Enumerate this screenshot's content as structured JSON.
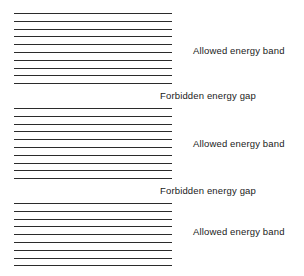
{
  "diagram": {
    "background_color": "#ffffff",
    "line_color": "#2b2b2b",
    "text_color": "#1a1a1a",
    "labels": {
      "allowed": "Allowed energy band",
      "forbidden": "Forbidden energy gap"
    },
    "bands": [
      {
        "id": "allowed-band-1",
        "label": "Allowed energy band",
        "label_y": 45,
        "top": 13,
        "line_count": 10,
        "line_spacing": 7.8,
        "left": 14,
        "width": 158
      },
      {
        "id": "allowed-band-2",
        "label": "Allowed energy band",
        "label_y": 138,
        "top": 108,
        "line_count": 10,
        "line_spacing": 7.8,
        "left": 14,
        "width": 158
      },
      {
        "id": "allowed-band-3",
        "label": "Allowed energy band",
        "label_y": 226,
        "top": 203,
        "line_count": 9,
        "line_spacing": 7.8,
        "left": 14,
        "width": 158
      }
    ],
    "gaps": [
      {
        "id": "forbidden-gap-1",
        "label": "Forbidden energy gap",
        "label_y": 90,
        "top": 84,
        "bottom": 107
      },
      {
        "id": "forbidden-gap-2",
        "label": "Forbidden energy gap",
        "label_y": 185,
        "top": 179,
        "bottom": 202
      }
    ]
  }
}
